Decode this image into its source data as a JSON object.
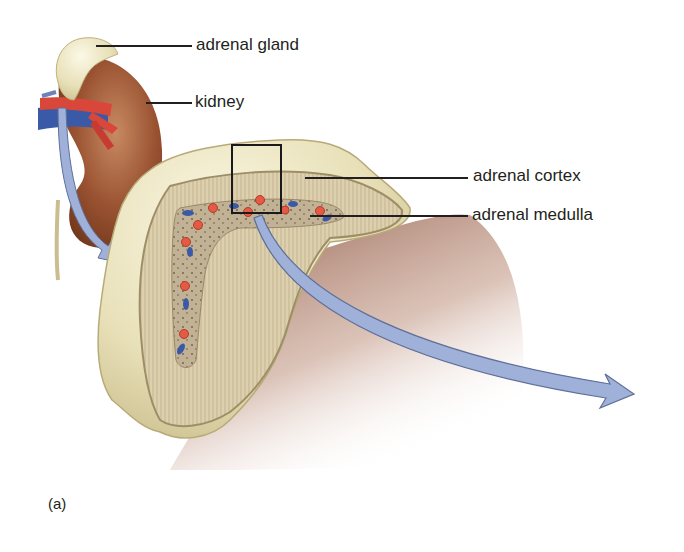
{
  "figure": {
    "panel_label": "(a)",
    "labels": {
      "adrenal_gland": "adrenal gland",
      "kidney": "kidney",
      "adrenal_cortex": "adrenal cortex",
      "adrenal_medulla": "adrenal medulla"
    },
    "colors": {
      "kidney": "#8b4a2b",
      "gland_outer": "#e6dfb8",
      "cortex": "#d9cba8",
      "medulla": "#b7a58a",
      "arrow": "#9fb1d9",
      "arrow_stroke": "#5f6f9a",
      "artery": "#d9463a",
      "vein": "#3a5aa8",
      "shadow": "#8a4e38"
    }
  }
}
